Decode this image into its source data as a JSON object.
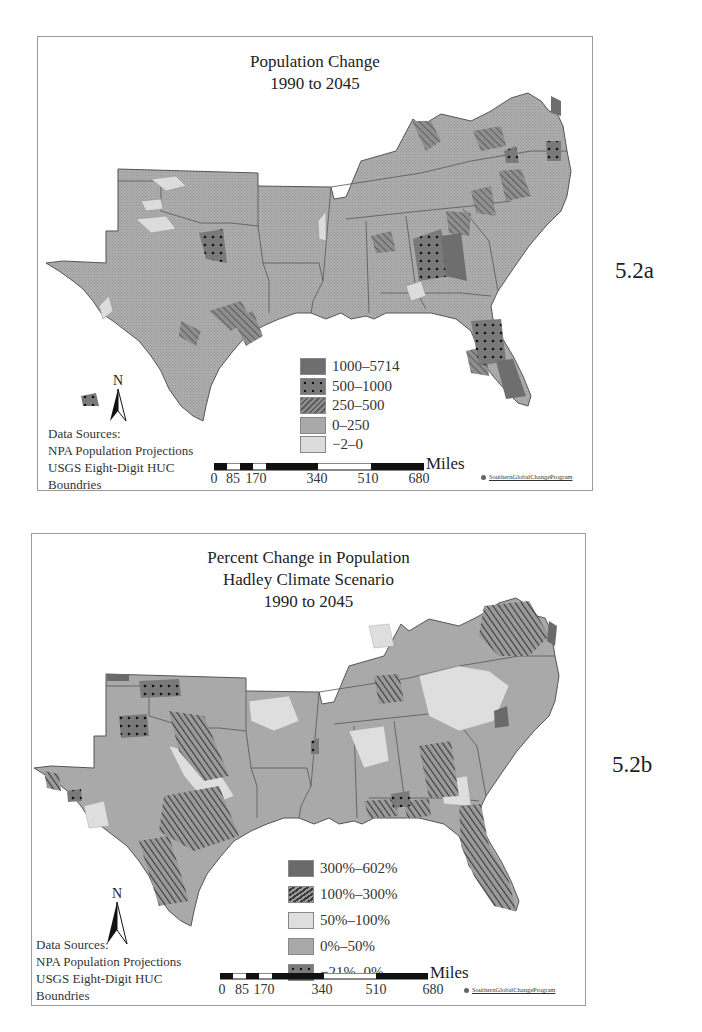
{
  "figure_a": {
    "label": "5.2a",
    "title_lines": [
      "Population Change",
      "1990 to 2045"
    ],
    "legend": [
      {
        "label": "1000–5714",
        "pattern": "dark-solid"
      },
      {
        "label": "500–1000",
        "pattern": "dark-dots"
      },
      {
        "label": "250–500",
        "pattern": "hatch"
      },
      {
        "label": "0–250",
        "pattern": "mid-gray"
      },
      {
        "label": "−2–0",
        "pattern": "light-gray"
      }
    ],
    "sources": [
      "Data Sources:",
      "NPA Population Projections",
      "USGS Eight-Digit HUC",
      "Boundries"
    ],
    "north_label": "N",
    "scale": {
      "ticks": [
        "0",
        "85",
        "170",
        "340",
        "510",
        "680"
      ],
      "unit": "Miles"
    },
    "credit": "SouthernGlobalChangeProgram"
  },
  "figure_b": {
    "label": "5.2b",
    "title_lines": [
      "Percent Change in Population",
      "Hadley Climate Scenario",
      "1990 to 2045"
    ],
    "legend": [
      {
        "label": "300%–602%",
        "pattern": "dark-solid"
      },
      {
        "label": "100%–300%",
        "pattern": "hatch-dark"
      },
      {
        "label": "50%–100%",
        "pattern": "light-gray"
      },
      {
        "label": "0%–50%",
        "pattern": "mid-gray"
      },
      {
        "label": "−21%–0%",
        "pattern": "dark-dots"
      }
    ],
    "sources": [
      "Data Sources:",
      "NPA Population Projections",
      "USGS Eight-Digit HUC",
      "Boundries"
    ],
    "north_label": "N",
    "scale": {
      "ticks": [
        "0",
        "85",
        "170",
        "340",
        "510",
        "680"
      ],
      "unit": "Miles"
    },
    "credit": "SouthernGlobalChangeProgram"
  },
  "colors": {
    "base_fill": "#a9a9a9",
    "light_fill": "#d9d9d9",
    "dark_fill": "#707070",
    "border": "#5a5a5a"
  }
}
